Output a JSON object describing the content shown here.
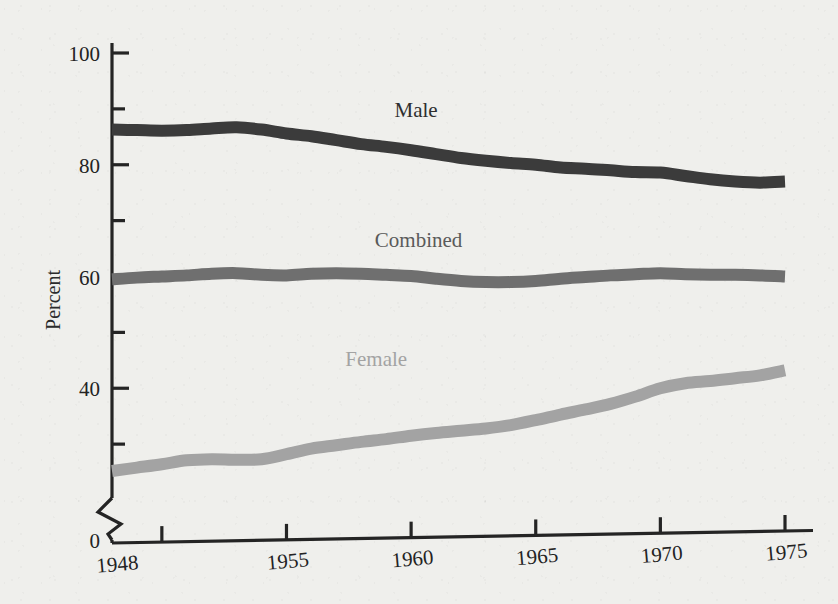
{
  "chart_data": {
    "type": "line",
    "title": "",
    "subtitle": "",
    "xlabel": "",
    "ylabel": "Percent",
    "xlim": [
      1948,
      1975
    ],
    "ylim": [
      0,
      100
    ],
    "y_axis_break": true,
    "y_break_range": [
      0,
      20
    ],
    "grid": false,
    "legend_position": "inline-labels",
    "x_ticks": [
      {
        "value": 1950,
        "label": ""
      },
      {
        "value": 1955,
        "label": "1955"
      },
      {
        "value": 1960,
        "label": "1960"
      },
      {
        "value": 1965,
        "label": "1965"
      },
      {
        "value": 1970,
        "label": "1970"
      },
      {
        "value": 1975,
        "label": "1975"
      }
    ],
    "x_origin_label": "1948",
    "y_ticks_major": [
      {
        "value": 0,
        "label": "0"
      },
      {
        "value": 40,
        "label": "40"
      },
      {
        "value": 60,
        "label": "60"
      },
      {
        "value": 80,
        "label": "80"
      },
      {
        "value": 100,
        "label": "100"
      }
    ],
    "y_ticks_minor": [
      {
        "value": 30,
        "label": ""
      },
      {
        "value": 50,
        "label": ""
      },
      {
        "value": 70,
        "label": ""
      },
      {
        "value": 90,
        "label": ""
      }
    ],
    "series": [
      {
        "name": "Male",
        "color": "#3b3b3b",
        "label_color": "#2e2e2e",
        "label_x": 1960.2,
        "label_y": 88.5,
        "x": [
          1948,
          1949,
          1950,
          1951,
          1952,
          1953,
          1954,
          1955,
          1956,
          1957,
          1958,
          1959,
          1960,
          1961,
          1962,
          1963,
          1964,
          1965,
          1966,
          1967,
          1968,
          1969,
          1970,
          1971,
          1972,
          1973,
          1974,
          1975
        ],
        "values": [
          86.3,
          86.2,
          86.1,
          86.2,
          86.5,
          86.7,
          86.3,
          85.6,
          85.1,
          84.4,
          83.7,
          83.2,
          82.6,
          81.9,
          81.2,
          80.7,
          80.3,
          80.0,
          79.5,
          79.3,
          79.0,
          78.7,
          78.6,
          78.0,
          77.4,
          77.0,
          76.8,
          77.0
        ]
      },
      {
        "name": "Combined",
        "color": "#6f6f6f",
        "label_color": "#5a5a5a",
        "label_x": 1960.3,
        "label_y": 65.2,
        "x": [
          1948,
          1949,
          1950,
          1951,
          1952,
          1953,
          1954,
          1955,
          1956,
          1957,
          1958,
          1959,
          1960,
          1961,
          1962,
          1963,
          1964,
          1965,
          1966,
          1967,
          1968,
          1969,
          1970,
          1971,
          1972,
          1973,
          1974,
          1975
        ],
        "values": [
          59.5,
          59.8,
          60.0,
          60.2,
          60.5,
          60.6,
          60.3,
          60.2,
          60.5,
          60.6,
          60.5,
          60.3,
          60.1,
          59.6,
          59.2,
          59.0,
          59.0,
          59.2,
          59.6,
          59.9,
          60.2,
          60.4,
          60.6,
          60.4,
          60.3,
          60.3,
          60.2,
          60.0
        ]
      },
      {
        "name": "Female",
        "color": "#a3a3a3",
        "label_color": "#a3a3a3",
        "label_x": 1958.6,
        "label_y": 44.0,
        "x": [
          1948,
          1949,
          1950,
          1951,
          1952,
          1953,
          1954,
          1955,
          1956,
          1957,
          1958,
          1959,
          1960,
          1961,
          1962,
          1963,
          1964,
          1965,
          1966,
          1967,
          1968,
          1969,
          1970,
          1971,
          1972,
          1973,
          1974,
          1975
        ],
        "values": [
          25.2,
          25.8,
          26.4,
          27.1,
          27.3,
          27.2,
          27.3,
          28.2,
          29.2,
          29.8,
          30.4,
          30.9,
          31.5,
          32.0,
          32.4,
          32.8,
          33.4,
          34.3,
          35.3,
          36.2,
          37.2,
          38.5,
          40.0,
          40.9,
          41.3,
          41.8,
          42.3,
          43.2
        ]
      }
    ]
  }
}
